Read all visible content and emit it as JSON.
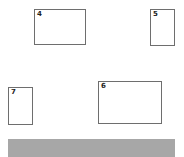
{
  "boxes": [
    {
      "id": "4",
      "label": "4"
    },
    {
      "id": "5",
      "label": "5"
    },
    {
      "id": "6",
      "label": "6"
    },
    {
      "id": "7",
      "label": "7"
    }
  ],
  "bar": {
    "color": "#a7a7a7"
  }
}
